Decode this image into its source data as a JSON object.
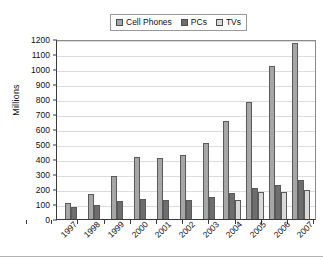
{
  "chart_data": {
    "type": "bar",
    "title": "",
    "xlabel": "",
    "ylabel": "Millions",
    "ylim": [
      0,
      1200
    ],
    "ytick_step": 100,
    "grid": true,
    "legend_position": "top-center",
    "categories": [
      "1997",
      "1998",
      "1999",
      "2000",
      "2001",
      "2002",
      "2003",
      "2004",
      "2005",
      "2006",
      "2007"
    ],
    "yticks": [
      "1200",
      "1100",
      "1000",
      "900",
      "800",
      "700",
      "600",
      "500",
      "400",
      "300",
      "200",
      "100",
      "0"
    ],
    "series": [
      {
        "name": "Cell Phones",
        "color": "#a6a6a6",
        "values": [
          110,
          170,
          290,
          415,
          405,
          425,
          505,
          655,
          780,
          1020,
          1175
        ]
      },
      {
        "name": "PCs",
        "color": "#6e6e6e",
        "values": [
          80,
          95,
          120,
          135,
          128,
          130,
          148,
          172,
          208,
          228,
          260
        ]
      },
      {
        "name": "TVs",
        "color": "#d9d9d9",
        "values": [
          0,
          0,
          0,
          0,
          0,
          0,
          0,
          130,
          178,
          182,
          195
        ]
      }
    ]
  }
}
